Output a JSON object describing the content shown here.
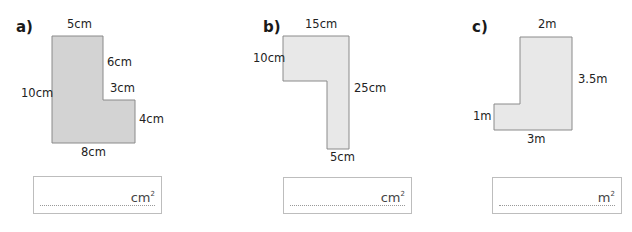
{
  "questions": [
    {
      "label": "a)",
      "shape_fill": "#d3d3d3",
      "dimensions": {
        "top": "5cm",
        "right_upper": "6cm",
        "step": "3cm",
        "right_lower": "4cm",
        "left": "10cm",
        "bottom": "8cm"
      },
      "answer": {
        "value": "",
        "unit": "cm",
        "exponent": "2"
      }
    },
    {
      "label": "b)",
      "shape_fill": "#e8e8e8",
      "dimensions": {
        "top": "15cm",
        "left": "10cm",
        "right": "25cm",
        "bottom": "5cm"
      },
      "answer": {
        "value": "",
        "unit": "cm",
        "exponent": "2"
      }
    },
    {
      "label": "c)",
      "shape_fill": "#e8e8e8",
      "dimensions": {
        "top": "2m",
        "right": "3.5m",
        "left": "1m",
        "bottom": "3m"
      },
      "answer": {
        "value": "",
        "unit": "m",
        "exponent": "2"
      }
    }
  ]
}
